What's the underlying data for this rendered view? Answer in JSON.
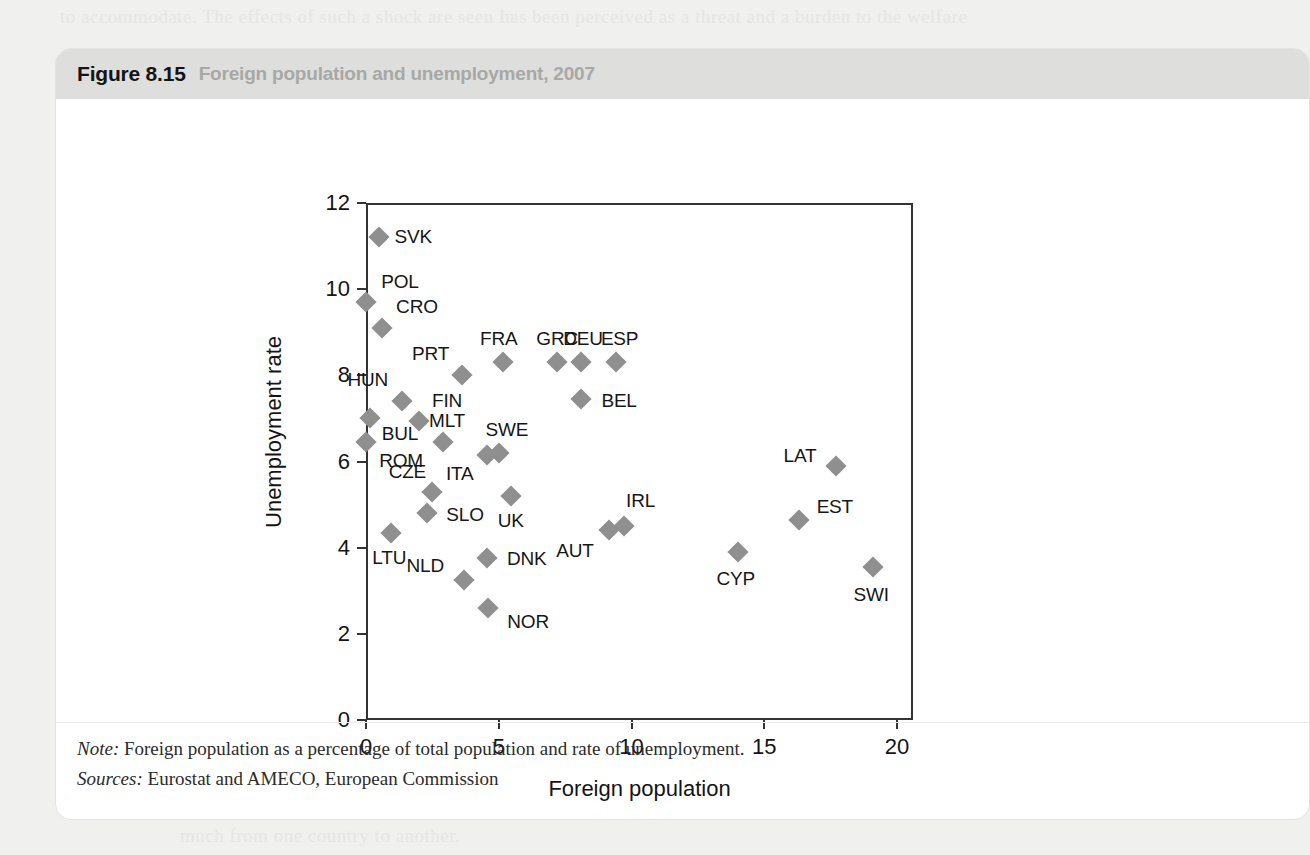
{
  "page": {
    "background_color": "#f0f0ee",
    "ghost_text": [
      "to accommodate. The effects of such a shock are seen in",
      "has been perceived as a threat and a burden to the welfare",
      "commonly believed that the immigrants take away jobs from",
      "unemployment among natives. Figure 8.15 shows that there",
      "much from one country to another."
    ]
  },
  "figure": {
    "number": "Figure 8.15",
    "caption": "Foreign population and unemployment, 2007",
    "header_color": "#dededc",
    "marker_color": "#8f8f8f",
    "notes": [
      {
        "lead": "Note:",
        "text": " Foreign population as a percentage of total population and rate of unemployment."
      },
      {
        "lead": "Sources:",
        "text": " Eurostat and AMECO, European Commission"
      }
    ]
  },
  "chart_data": {
    "type": "scatter",
    "title": "Foreign population and unemployment, 2007",
    "xlabel": "Foreign population",
    "ylabel": "Unemployment rate",
    "xlim": [
      0,
      20.6
    ],
    "ylim": [
      0,
      12
    ],
    "xticks": [
      0,
      5,
      10,
      15,
      20
    ],
    "yticks": [
      0,
      2,
      4,
      6,
      8,
      10,
      12
    ],
    "xtick_labels": [
      "0",
      "5",
      "10",
      "15",
      "20"
    ],
    "ytick_labels": [
      "0",
      "2",
      "4",
      "6",
      "8",
      "10",
      "12"
    ],
    "grid": false,
    "legend": false,
    "points": [
      {
        "label": "SVK",
        "x": 0.5,
        "y": 11.2,
        "label_dx": 34,
        "label_dy": 0
      },
      {
        "label": "POL",
        "x": 0.0,
        "y": 9.7,
        "label_dx": 34,
        "label_dy": -20
      },
      {
        "label": "CRO",
        "x": 0.6,
        "y": 9.1,
        "label_dx": 35,
        "label_dy": -21
      },
      {
        "label": "HUN",
        "x": 1.35,
        "y": 7.4,
        "label_dx": -34,
        "label_dy": -21
      },
      {
        "label": "BUL",
        "x": 0.15,
        "y": 7.0,
        "label_dx": 30,
        "label_dy": 16
      },
      {
        "label": "ROM",
        "x": 0.0,
        "y": 6.45,
        "label_dx": 35,
        "label_dy": 19
      },
      {
        "label": "FIN",
        "x": 2.0,
        "y": 6.95,
        "label_dx": 28,
        "label_dy": -20
      },
      {
        "label": "MLT",
        "x": 2.9,
        "y": 6.45,
        "label_dx": 4,
        "label_dy": -21
      },
      {
        "label": "PRT",
        "x": 3.6,
        "y": 8.0,
        "label_dx": -31,
        "label_dy": -21
      },
      {
        "label": "CZE",
        "x": 2.5,
        "y": 5.3,
        "label_dx": -25,
        "label_dy": -20
      },
      {
        "label": "SLO",
        "x": 2.3,
        "y": 4.8,
        "label_dx": 38,
        "label_dy": 2
      },
      {
        "label": "ITA",
        "x": 4.55,
        "y": 6.15,
        "label_dx": -27,
        "label_dy": 19
      },
      {
        "label": "SWE",
        "x": 5.0,
        "y": 6.2,
        "label_dx": 8,
        "label_dy": -23
      },
      {
        "label": "FRA",
        "x": 5.15,
        "y": 8.3,
        "label_dx": -4,
        "label_dy": -23
      },
      {
        "label": "GRC",
        "x": 7.2,
        "y": 8.3,
        "label_dx": 0,
        "label_dy": -23
      },
      {
        "label": "DEU",
        "x": 8.1,
        "y": 8.3,
        "label_dx": 2,
        "label_dy": -23
      },
      {
        "label": "ESP",
        "x": 9.4,
        "y": 8.3,
        "label_dx": 4,
        "label_dy": -23
      },
      {
        "label": "BEL",
        "x": 8.1,
        "y": 7.45,
        "label_dx": 38,
        "label_dy": 2
      },
      {
        "label": "UK",
        "x": 5.45,
        "y": 5.2,
        "label_dx": 0,
        "label_dy": 25
      },
      {
        "label": "LTU",
        "x": 0.95,
        "y": 4.35,
        "label_dx": -2,
        "label_dy": 25
      },
      {
        "label": "DNK",
        "x": 4.55,
        "y": 3.75,
        "label_dx": 40,
        "label_dy": 1
      },
      {
        "label": "NLD",
        "x": 3.7,
        "y": 3.25,
        "label_dx": -39,
        "label_dy": -14
      },
      {
        "label": "NOR",
        "x": 4.6,
        "y": 2.6,
        "label_dx": 40,
        "label_dy": 14
      },
      {
        "label": "AUT",
        "x": 9.15,
        "y": 4.4,
        "label_dx": -34,
        "label_dy": 21
      },
      {
        "label": "IRL",
        "x": 9.7,
        "y": 4.5,
        "label_dx": 17,
        "label_dy": -25
      },
      {
        "label": "CYP",
        "x": 14.0,
        "y": 3.9,
        "label_dx": -2,
        "label_dy": 27
      },
      {
        "label": "EST",
        "x": 16.3,
        "y": 4.65,
        "label_dx": 36,
        "label_dy": -13
      },
      {
        "label": "LAT",
        "x": 17.7,
        "y": 5.9,
        "label_dx": -36,
        "label_dy": -10
      },
      {
        "label": "SWI",
        "x": 19.1,
        "y": 3.55,
        "label_dx": -2,
        "label_dy": 28
      }
    ]
  }
}
